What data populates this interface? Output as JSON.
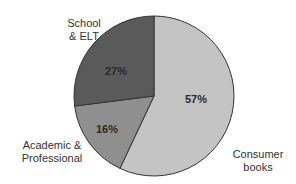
{
  "chart_data": {
    "type": "pie",
    "title": "",
    "start_angle_deg": 0,
    "direction": "clockwise",
    "legend": "none (direct labels)",
    "slices": [
      {
        "label": "Consumer books",
        "display_label": "Consumer\nbooks",
        "value": 57,
        "value_label": "57%",
        "color": "#c4c4c4"
      },
      {
        "label": "Academic & Professional",
        "display_label": "Academic &\nProfessional",
        "value": 16,
        "value_label": "16%",
        "color": "#8f8f8f"
      },
      {
        "label": "School & ELT",
        "display_label": "School\n& ELT",
        "value": 27,
        "value_label": "27%",
        "color": "#5a5a5a"
      }
    ],
    "categories": [
      "Consumer books",
      "Academic & Professional",
      "School & ELT"
    ],
    "values": [
      57,
      16,
      27
    ],
    "outline_color": "#333333"
  },
  "labels": {
    "consumer": "Consumer\nbooks",
    "academic": "Academic &\nProfessional",
    "school": "School\n& ELT"
  },
  "percents": {
    "consumer": "57%",
    "academic": "16%",
    "school": "27%"
  }
}
